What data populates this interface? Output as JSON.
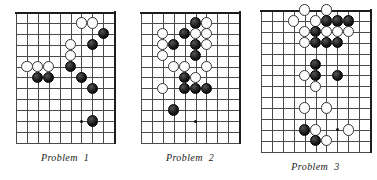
{
  "page": {
    "width": 377,
    "height": 180,
    "background": "#ffffff",
    "ink_color": "#1a1a1a",
    "grid_color": "#4a4a4a",
    "black_stone_color": "#111111",
    "white_stone_color": "#fdfdfd"
  },
  "diagrams": [
    {
      "id": "problem-1",
      "caption_label": "Problem",
      "caption_number": "1",
      "origin_x": 16,
      "origin_y": 12,
      "cell": 10.9,
      "cols": 9,
      "rows": 12,
      "edges": [
        "top",
        "right"
      ],
      "hoshi": [
        {
          "col": 6,
          "row": 10
        }
      ],
      "stones": [
        {
          "color": "white",
          "col": 6,
          "row": 1
        },
        {
          "color": "white",
          "col": 7,
          "row": 1
        },
        {
          "color": "black",
          "col": 8,
          "row": 2
        },
        {
          "color": "white",
          "col": 5,
          "row": 3
        },
        {
          "color": "black",
          "col": 7,
          "row": 3
        },
        {
          "color": "white",
          "col": 5,
          "row": 4
        },
        {
          "color": "white",
          "col": 1,
          "row": 5
        },
        {
          "color": "white",
          "col": 2,
          "row": 5
        },
        {
          "color": "white",
          "col": 3,
          "row": 5
        },
        {
          "color": "black",
          "col": 5,
          "row": 5
        },
        {
          "color": "black",
          "col": 2,
          "row": 6
        },
        {
          "color": "black",
          "col": 3,
          "row": 6
        },
        {
          "color": "black",
          "col": 6,
          "row": 6
        },
        {
          "color": "black",
          "col": 7,
          "row": 7
        },
        {
          "color": "black",
          "col": 7,
          "row": 10
        }
      ]
    },
    {
      "id": "problem-2",
      "caption_label": "Problem",
      "caption_number": "2",
      "origin_x": 141,
      "origin_y": 12,
      "cell": 10.9,
      "cols": 9,
      "rows": 12,
      "edges": [
        "top",
        "right"
      ],
      "hoshi": [
        {
          "col": 5,
          "row": 10
        }
      ],
      "stones": [
        {
          "color": "black",
          "col": 5,
          "row": 1
        },
        {
          "color": "white",
          "col": 6,
          "row": 1
        },
        {
          "color": "white",
          "col": 2,
          "row": 2
        },
        {
          "color": "black",
          "col": 4,
          "row": 2
        },
        {
          "color": "white",
          "col": 5,
          "row": 2
        },
        {
          "color": "white",
          "col": 6,
          "row": 2
        },
        {
          "color": "white",
          "col": 2,
          "row": 3
        },
        {
          "color": "black",
          "col": 3,
          "row": 3
        },
        {
          "color": "black",
          "col": 5,
          "row": 3
        },
        {
          "color": "white",
          "col": 6,
          "row": 3
        },
        {
          "color": "white",
          "col": 2,
          "row": 4
        },
        {
          "color": "black",
          "col": 5,
          "row": 4
        },
        {
          "color": "white",
          "col": 3,
          "row": 5
        },
        {
          "color": "white",
          "col": 4,
          "row": 5
        },
        {
          "color": "white",
          "col": 6,
          "row": 5
        },
        {
          "color": "black",
          "col": 4,
          "row": 6
        },
        {
          "color": "white",
          "col": 5,
          "row": 6
        },
        {
          "color": "white",
          "col": 2,
          "row": 7
        },
        {
          "color": "black",
          "col": 4,
          "row": 7
        },
        {
          "color": "black",
          "col": 5,
          "row": 7
        },
        {
          "color": "black",
          "col": 6,
          "row": 7
        },
        {
          "color": "black",
          "col": 3,
          "row": 9
        }
      ]
    },
    {
      "id": "problem-3",
      "caption_label": "Problem",
      "caption_number": "3",
      "origin_x": 261,
      "origin_y": 10,
      "cell": 10.9,
      "cols": 10,
      "rows": 13,
      "edges": [
        "top",
        "right"
      ],
      "hoshi": [
        {
          "col": 7,
          "row": 11
        }
      ],
      "stones": [
        {
          "color": "white",
          "col": 4,
          "row": 0
        },
        {
          "color": "white",
          "col": 6,
          "row": 0
        },
        {
          "color": "white",
          "col": 3,
          "row": 1
        },
        {
          "color": "white",
          "col": 5,
          "row": 1
        },
        {
          "color": "black",
          "col": 6,
          "row": 1
        },
        {
          "color": "black",
          "col": 7,
          "row": 1
        },
        {
          "color": "black",
          "col": 8,
          "row": 1
        },
        {
          "color": "white",
          "col": 4,
          "row": 2
        },
        {
          "color": "black",
          "col": 5,
          "row": 2
        },
        {
          "color": "white",
          "col": 6,
          "row": 2
        },
        {
          "color": "white",
          "col": 7,
          "row": 2
        },
        {
          "color": "white",
          "col": 8,
          "row": 2
        },
        {
          "color": "white",
          "col": 4,
          "row": 3
        },
        {
          "color": "black",
          "col": 5,
          "row": 3
        },
        {
          "color": "black",
          "col": 6,
          "row": 3
        },
        {
          "color": "black",
          "col": 7,
          "row": 3
        },
        {
          "color": "black",
          "col": 5,
          "row": 5
        },
        {
          "color": "white",
          "col": 4,
          "row": 6
        },
        {
          "color": "black",
          "col": 5,
          "row": 6
        },
        {
          "color": "black",
          "col": 7,
          "row": 6
        },
        {
          "color": "white",
          "col": 5,
          "row": 7
        },
        {
          "color": "white",
          "col": 4,
          "row": 9
        },
        {
          "color": "white",
          "col": 6,
          "row": 9
        },
        {
          "color": "black",
          "col": 4,
          "row": 11
        },
        {
          "color": "white",
          "col": 5,
          "row": 11
        },
        {
          "color": "white",
          "col": 8,
          "row": 11
        },
        {
          "color": "black",
          "col": 5,
          "row": 12
        },
        {
          "color": "white",
          "col": 6,
          "row": 12
        }
      ]
    }
  ]
}
